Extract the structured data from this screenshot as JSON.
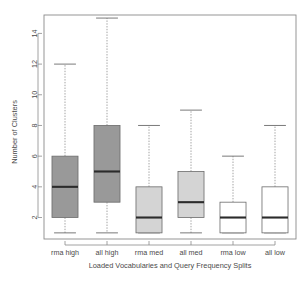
{
  "chart_data": {
    "type": "box",
    "title": "",
    "xlabel": "Loaded Vocabularies and Query Frequency Splits",
    "ylabel": "Number of Clusters",
    "categories": [
      "rma high",
      "all high",
      "rma med",
      "all med",
      "rma low",
      "all low"
    ],
    "ylim": [
      0.6,
      15.2
    ],
    "yticks": [
      2,
      4,
      6,
      8,
      10,
      12,
      14
    ],
    "ytick_labels": [
      "2",
      "4",
      "6",
      "8",
      "10",
      "12",
      "14"
    ],
    "grid": false,
    "legend": "none",
    "boxes": [
      {
        "category": "rma high",
        "min": 1,
        "q1": 2,
        "median": 4,
        "q3": 6,
        "max": 12,
        "fill": "#999999"
      },
      {
        "category": "all high",
        "min": 1,
        "q1": 3,
        "median": 5,
        "q3": 8,
        "max": 15,
        "fill": "#999999"
      },
      {
        "category": "rma med",
        "min": 1,
        "q1": 1,
        "median": 2,
        "q3": 4,
        "max": 8,
        "fill": "#d4d4d4"
      },
      {
        "category": "all med",
        "min": 1,
        "q1": 2,
        "median": 3,
        "q3": 5,
        "max": 9,
        "fill": "#d4d4d4"
      },
      {
        "category": "rma low",
        "min": 1,
        "q1": 1,
        "median": 2,
        "q3": 3,
        "max": 6,
        "fill": "#ffffff"
      },
      {
        "category": "all low",
        "min": 1,
        "q1": 1,
        "median": 2,
        "q3": 4,
        "max": 8,
        "fill": "#ffffff"
      }
    ]
  },
  "colors": {
    "axis": "#8a8a8a",
    "text": "#4a4a4a",
    "median": "#2b2b2b",
    "box_border": "#6b6b6b",
    "dark_fill": "#999999",
    "light_fill": "#d4d4d4",
    "white_fill": "#ffffff",
    "background": "#ffffff"
  }
}
